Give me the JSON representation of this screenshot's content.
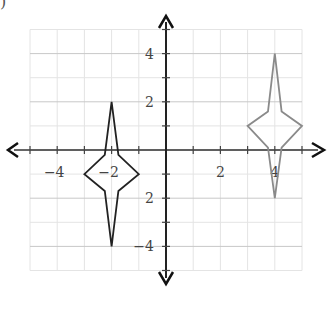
{
  "figure": {
    "label": ")"
  },
  "chart_data": {
    "type": "line",
    "title": "",
    "xlabel": "",
    "ylabel": "",
    "xlim": [
      -5,
      5
    ],
    "ylim": [
      -5,
      5
    ],
    "grid": true,
    "x_tick_labels": [
      {
        "value": -4,
        "text": "−4"
      },
      {
        "value": -2,
        "text": "−2"
      },
      {
        "value": 2,
        "text": "2"
      },
      {
        "value": 4,
        "text": "4"
      }
    ],
    "y_tick_labels": [
      {
        "value": 4,
        "text": "4"
      },
      {
        "value": 2,
        "text": "2"
      },
      {
        "value": -2,
        "text": "2"
      },
      {
        "value": -4,
        "text": "−4"
      }
    ],
    "series": [
      {
        "name": "original-shape",
        "color": "#222222",
        "closed": true,
        "points": [
          [
            -2,
            2
          ],
          [
            -1.75,
            -0.2
          ],
          [
            -1,
            -1
          ],
          [
            -1.75,
            -1.7
          ],
          [
            -2,
            -4
          ],
          [
            -2.25,
            -1.7
          ],
          [
            -3,
            -1
          ],
          [
            -2.25,
            -0.2
          ]
        ]
      },
      {
        "name": "translated-shape",
        "color": "#8a8a8a",
        "closed": true,
        "points": [
          [
            4,
            4
          ],
          [
            4.25,
            1.6
          ],
          [
            5,
            1
          ],
          [
            4.25,
            0.1
          ],
          [
            4,
            -2
          ],
          [
            3.75,
            0.1
          ],
          [
            3,
            1
          ],
          [
            3.75,
            1.6
          ]
        ]
      }
    ]
  }
}
